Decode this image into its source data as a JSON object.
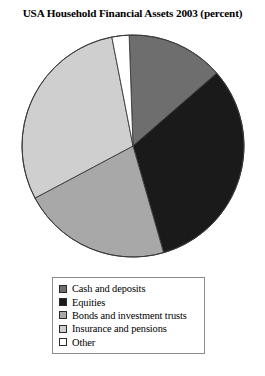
{
  "chart_data": {
    "type": "pie",
    "title": "USA Household Financial Assets 2003 (percent)",
    "xlabel": "",
    "ylabel": "",
    "grid": false,
    "legend_position": "bottom",
    "start_angle_deg": 349,
    "direction": "clockwise",
    "categories": [
      "Cash and deposits",
      "Equities",
      "Bonds and investment trusts",
      "Insurance and pensions",
      "Other"
    ],
    "values": [
      14,
      32,
      22,
      29,
      3
    ],
    "colors": [
      "#6e6e6e",
      "#1a1a1a",
      "#a8a8a8",
      "#cfcfcf",
      "#ffffff"
    ],
    "slices": [
      {
        "label": "Cash and deposits",
        "value": 14,
        "color": "#6e6e6e",
        "start_deg": 358,
        "end_deg": 49
      },
      {
        "label": "Equities",
        "value": 32,
        "color": "#1a1a1a",
        "start_deg": 49,
        "end_deg": 164
      },
      {
        "label": "Bonds and investment trusts",
        "value": 22,
        "color": "#a8a8a8",
        "start_deg": 164,
        "end_deg": 242
      },
      {
        "label": "Insurance and pensions",
        "value": 29,
        "color": "#cfcfcf",
        "start_deg": 242,
        "end_deg": 349
      },
      {
        "label": "Other",
        "value": 3,
        "color": "#ffffff",
        "start_deg": 349,
        "end_deg": 358
      }
    ]
  },
  "legend": {
    "items": [
      {
        "label": "Cash and deposits",
        "color": "#6e6e6e"
      },
      {
        "label": "Equities",
        "color": "#1a1a1a"
      },
      {
        "label": "Bonds and investment trusts",
        "color": "#a8a8a8"
      },
      {
        "label": "Insurance and pensions",
        "color": "#cfcfcf"
      },
      {
        "label": "Other",
        "color": "#ffffff"
      }
    ]
  },
  "style": {
    "pie_center_x": 133,
    "pie_center_y": 146,
    "pie_radius": 111,
    "outline_color": "#3a3a3a",
    "legend_border": "#8b8b8b"
  }
}
